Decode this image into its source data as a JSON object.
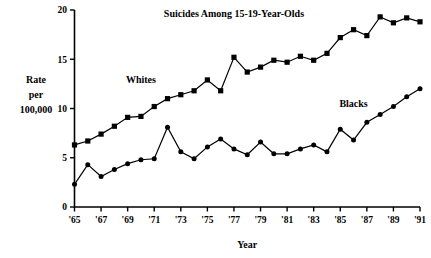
{
  "chart_data": {
    "type": "line",
    "title": "Suicides Among 15-19-Year-Olds",
    "xlabel": "Year",
    "ylabel": "Rate per 100,000",
    "ylabel_lines": [
      "Rate",
      "per",
      "100,000"
    ],
    "xlim": [
      1965,
      1991
    ],
    "ylim": [
      0,
      20
    ],
    "yticks": [
      0,
      5,
      10,
      15,
      20
    ],
    "ytick_labels": [
      "0",
      "5",
      "10",
      "15",
      "20"
    ],
    "xticks": [
      1965,
      1967,
      1969,
      1971,
      1973,
      1975,
      1977,
      1979,
      1981,
      1983,
      1985,
      1987,
      1989,
      1991
    ],
    "xtick_labels": [
      "'65",
      "'67",
      "'69",
      "'71",
      "'73",
      "'75",
      "'77",
      "'79",
      "'81",
      "'83",
      "'85",
      "'87",
      "'89",
      "'91"
    ],
    "grid": false,
    "legend_position": "inline-annotation",
    "x": [
      1965,
      1966,
      1967,
      1968,
      1969,
      1970,
      1971,
      1972,
      1973,
      1974,
      1975,
      1976,
      1977,
      1978,
      1979,
      1980,
      1981,
      1982,
      1983,
      1984,
      1985,
      1986,
      1987,
      1988,
      1989,
      1990,
      1991
    ],
    "series": [
      {
        "name": "Whites",
        "marker": "square",
        "color": "#000000",
        "label_x": 1970,
        "label_y": 12.6,
        "values": [
          6.3,
          6.7,
          7.4,
          8.2,
          9.1,
          9.2,
          10.2,
          11.0,
          11.4,
          11.8,
          12.9,
          11.8,
          15.2,
          13.7,
          14.2,
          14.9,
          14.7,
          15.3,
          14.9,
          15.6,
          17.2,
          18.0,
          17.4,
          19.3,
          18.7,
          19.2,
          18.8
        ]
      },
      {
        "name": "Blacks",
        "marker": "circle",
        "color": "#000000",
        "label_x": 1986,
        "label_y": 10.2,
        "values": [
          2.3,
          4.3,
          3.1,
          3.8,
          4.4,
          4.8,
          4.9,
          8.1,
          5.6,
          4.9,
          6.1,
          6.9,
          5.9,
          5.3,
          6.6,
          5.4,
          5.4,
          5.9,
          6.3,
          5.6,
          7.9,
          6.8,
          8.6,
          9.4,
          10.2,
          11.2,
          12.0
        ]
      }
    ],
    "annotations": [
      {
        "text": "Whites",
        "x": 1970,
        "y": 12.6
      },
      {
        "text": "Blacks",
        "x": 1986,
        "y": 10.2
      }
    ]
  }
}
